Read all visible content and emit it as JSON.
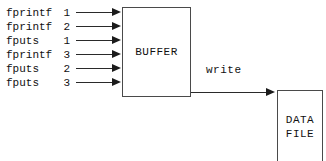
{
  "diagram": {
    "type": "flow-diagram",
    "background_color": "#ffffff",
    "line_color": "#2a2a2a",
    "text_color": "#111111",
    "calls": [
      {
        "function": "fprintf",
        "index": "1",
        "arrow": "right-arrow-icon"
      },
      {
        "function": "fprintf",
        "index": "2",
        "arrow": "right-arrow-icon"
      },
      {
        "function": "fputs",
        "index": "1",
        "arrow": "right-arrow-icon"
      },
      {
        "function": "fprintf",
        "index": "3",
        "arrow": "right-arrow-icon"
      },
      {
        "function": "fputs",
        "index": "2",
        "arrow": "right-arrow-icon"
      },
      {
        "function": "fputs",
        "index": "3",
        "arrow": "right-arrow-icon"
      }
    ],
    "buffer": {
      "label": "BUFFER"
    },
    "write": {
      "label": "write",
      "arrow": "right-arrow-icon"
    },
    "data_file": {
      "line1": "DATA",
      "line2": "FILE"
    }
  }
}
